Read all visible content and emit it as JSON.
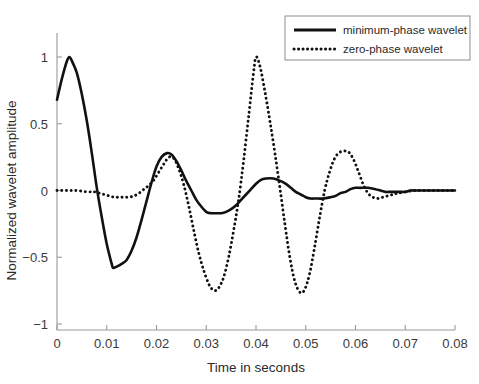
{
  "chart_data": {
    "type": "line",
    "title": "",
    "xlabel": "Time in seconds",
    "ylabel": "Normalized wavelet amplitude",
    "xlim": [
      0,
      0.08
    ],
    "ylim": [
      -1,
      1
    ],
    "xticks": [
      0,
      0.01,
      0.02,
      0.03,
      0.04,
      0.05,
      0.06,
      0.07,
      0.08
    ],
    "xtick_labels": [
      "0",
      "0.01",
      "0.02",
      "0.03",
      "0.04",
      "0.05",
      "0.06",
      "0.07",
      "0.08"
    ],
    "yticks": [
      -1,
      -0.5,
      0,
      0.5,
      1
    ],
    "ytick_labels": [
      "-1",
      "-0.5",
      "0",
      "0.5",
      "1"
    ],
    "grid": false,
    "legend_position": "upper right",
    "series": [
      {
        "name": "minimum-phase wavelet",
        "style": "solid",
        "color": "#111111",
        "x": [
          0.0,
          0.001,
          0.002,
          0.0025,
          0.003,
          0.004,
          0.005,
          0.006,
          0.007,
          0.008,
          0.009,
          0.01,
          0.011,
          0.0113,
          0.012,
          0.013,
          0.014,
          0.015,
          0.016,
          0.017,
          0.018,
          0.019,
          0.02,
          0.021,
          0.0221,
          0.023,
          0.024,
          0.025,
          0.026,
          0.027,
          0.028,
          0.029,
          0.03,
          0.031,
          0.032,
          0.033,
          0.034,
          0.035,
          0.036,
          0.037,
          0.038,
          0.039,
          0.04,
          0.041,
          0.042,
          0.0435,
          0.045,
          0.046,
          0.047,
          0.048,
          0.049,
          0.05,
          0.051,
          0.052,
          0.0535,
          0.055,
          0.056,
          0.057,
          0.058,
          0.059,
          0.06,
          0.061,
          0.0625,
          0.064,
          0.065,
          0.066,
          0.067,
          0.068,
          0.069,
          0.07,
          0.071,
          0.072,
          0.074,
          0.076,
          0.078,
          0.08
        ],
        "y": [
          0.68,
          0.84,
          0.97,
          1.0,
          0.97,
          0.88,
          0.72,
          0.52,
          0.28,
          0.02,
          -0.2,
          -0.4,
          -0.55,
          -0.58,
          -0.57,
          -0.55,
          -0.52,
          -0.45,
          -0.35,
          -0.22,
          -0.08,
          0.06,
          0.18,
          0.25,
          0.28,
          0.27,
          0.22,
          0.15,
          0.07,
          0.0,
          -0.07,
          -0.12,
          -0.16,
          -0.17,
          -0.17,
          -0.17,
          -0.16,
          -0.14,
          -0.11,
          -0.07,
          -0.03,
          0.01,
          0.05,
          0.08,
          0.09,
          0.09,
          0.07,
          0.05,
          0.02,
          -0.01,
          -0.03,
          -0.05,
          -0.06,
          -0.06,
          -0.06,
          -0.05,
          -0.04,
          -0.02,
          -0.01,
          0.01,
          0.02,
          0.02,
          0.02,
          0.01,
          0.0,
          -0.01,
          -0.01,
          -0.01,
          -0.01,
          -0.01,
          0.0,
          0.0,
          0.0,
          0.0,
          0.0,
          0.0
        ]
      },
      {
        "name": "zero-phase wavelet",
        "style": "dotted",
        "color": "#111111",
        "x": [
          0.0,
          0.002,
          0.004,
          0.006,
          0.0075,
          0.0085,
          0.0095,
          0.0105,
          0.0115,
          0.0125,
          0.0135,
          0.0145,
          0.0155,
          0.0165,
          0.0175,
          0.0185,
          0.0195,
          0.0205,
          0.0215,
          0.0225,
          0.0235,
          0.0245,
          0.0255,
          0.0265,
          0.0275,
          0.0285,
          0.0295,
          0.0305,
          0.0312,
          0.0318,
          0.0325,
          0.0335,
          0.0345,
          0.0355,
          0.0365,
          0.0375,
          0.0385,
          0.0395,
          0.04,
          0.0408,
          0.0418,
          0.0428,
          0.0438,
          0.0448,
          0.0458,
          0.0468,
          0.0478,
          0.0489,
          0.0498,
          0.0508,
          0.0518,
          0.0528,
          0.0538,
          0.0548,
          0.0558,
          0.057,
          0.0585,
          0.0595,
          0.0605,
          0.0615,
          0.0625,
          0.0635,
          0.0645,
          0.0655,
          0.0665,
          0.0675,
          0.0685,
          0.07,
          0.072,
          0.074,
          0.076,
          0.078,
          0.08
        ],
        "y": [
          0.0,
          0.0,
          0.0,
          -0.01,
          -0.01,
          -0.02,
          -0.03,
          -0.04,
          -0.05,
          -0.05,
          -0.05,
          -0.05,
          -0.04,
          -0.02,
          0.01,
          0.04,
          0.08,
          0.14,
          0.2,
          0.25,
          0.24,
          0.16,
          0.04,
          -0.12,
          -0.3,
          -0.47,
          -0.6,
          -0.7,
          -0.74,
          -0.75,
          -0.73,
          -0.65,
          -0.5,
          -0.3,
          -0.07,
          0.22,
          0.55,
          0.88,
          1.0,
          0.93,
          0.74,
          0.52,
          0.28,
          0.02,
          -0.25,
          -0.5,
          -0.68,
          -0.765,
          -0.74,
          -0.62,
          -0.42,
          -0.2,
          0.0,
          0.14,
          0.24,
          0.29,
          0.29,
          0.24,
          0.15,
          0.05,
          -0.02,
          -0.05,
          -0.06,
          -0.05,
          -0.04,
          -0.03,
          -0.02,
          -0.01,
          0.0,
          0.0,
          0.0,
          0.0,
          0.0
        ]
      }
    ]
  },
  "legend": {
    "entries": [
      {
        "label": "minimum-phase wavelet",
        "style": "solid"
      },
      {
        "label": "zero-phase wavelet",
        "style": "dotted"
      }
    ]
  }
}
